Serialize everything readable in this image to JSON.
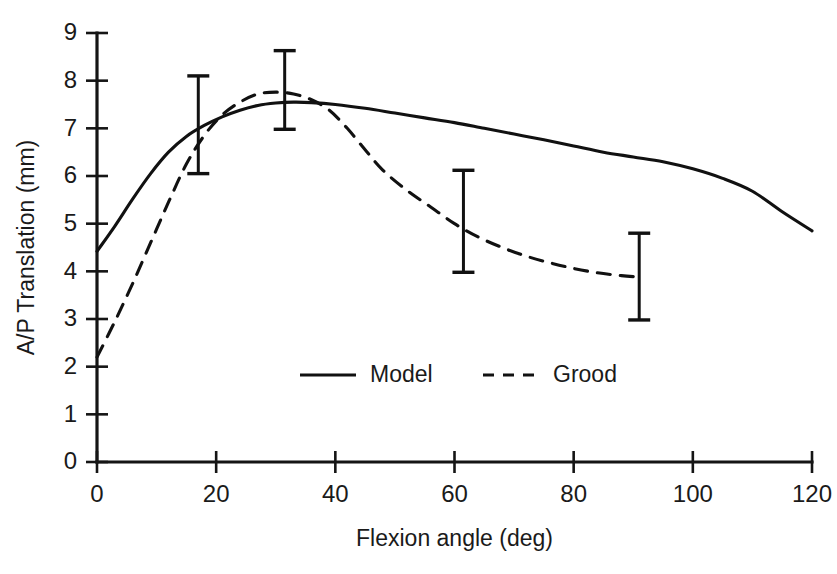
{
  "chart_data": {
    "type": "line",
    "title": "",
    "xlabel": "Flexion angle (deg)",
    "ylabel": "A/P Translation (mm)",
    "xlim": [
      0,
      120
    ],
    "ylim": [
      0,
      9
    ],
    "xticks": [
      0,
      20,
      40,
      60,
      80,
      100,
      120
    ],
    "yticks": [
      0,
      1,
      2,
      3,
      4,
      5,
      6,
      7,
      8,
      9
    ],
    "xticklabels": [
      "0",
      "20",
      "40",
      "60",
      "80",
      "100",
      "120"
    ],
    "yticklabels": [
      "0",
      "1",
      "2",
      "3",
      "4",
      "5",
      "6",
      "7",
      "8",
      "9"
    ],
    "grid": false,
    "legend_position": "center-bottom",
    "series": [
      {
        "name": "Model",
        "style": "solid",
        "color": "#111111",
        "x": [
          0,
          3,
          6,
          9,
          12,
          15,
          18,
          21,
          24,
          27,
          30,
          33,
          36,
          40,
          45,
          50,
          55,
          60,
          65,
          70,
          75,
          80,
          85,
          90,
          95,
          100,
          105,
          110,
          115,
          120
        ],
        "y": [
          4.42,
          4.95,
          5.52,
          6.05,
          6.5,
          6.83,
          7.06,
          7.24,
          7.38,
          7.48,
          7.53,
          7.55,
          7.54,
          7.5,
          7.42,
          7.32,
          7.22,
          7.12,
          7.0,
          6.88,
          6.76,
          6.63,
          6.5,
          6.4,
          6.3,
          6.15,
          5.95,
          5.68,
          5.25,
          4.85
        ]
      },
      {
        "name": "Grood",
        "style": "dashed",
        "color": "#111111",
        "x": [
          0,
          3,
          6,
          9,
          12,
          15,
          18,
          21,
          24,
          27,
          30,
          33,
          36,
          39,
          42,
          45,
          48,
          52,
          56,
          60,
          64,
          68,
          72,
          76,
          80,
          84,
          88,
          91
        ],
        "y": [
          2.2,
          2.95,
          3.75,
          4.6,
          5.45,
          6.25,
          6.85,
          7.28,
          7.55,
          7.72,
          7.76,
          7.72,
          7.6,
          7.38,
          7.0,
          6.55,
          6.12,
          5.7,
          5.35,
          5.0,
          4.72,
          4.5,
          4.32,
          4.18,
          4.06,
          3.97,
          3.91,
          3.88
        ]
      }
    ],
    "errorbars": [
      {
        "x": 17,
        "y": 7.08,
        "low": 6.05,
        "high": 8.1
      },
      {
        "x": 31.5,
        "y": 7.6,
        "low": 6.98,
        "high": 8.63
      },
      {
        "x": 61.5,
        "y": 5.0,
        "low": 3.98,
        "high": 6.12
      },
      {
        "x": 91,
        "y": 3.9,
        "low": 2.98,
        "high": 4.8
      }
    ],
    "legend": [
      {
        "label": "Model",
        "style": "solid"
      },
      {
        "label": "Grood",
        "style": "dashed"
      }
    ]
  },
  "layout": {
    "plot_left": 97,
    "plot_right": 812,
    "plot_top": 33,
    "plot_bottom": 462,
    "legend_x": 300,
    "legend_y": 375
  }
}
